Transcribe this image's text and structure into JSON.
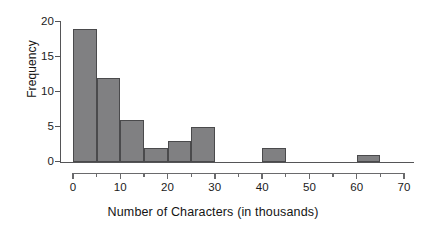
{
  "chart_data": {
    "type": "bar",
    "title": "",
    "subtitle": "",
    "xlabel": "Number of Characters (in thousands)",
    "ylabel": "Frequency",
    "xlim": [
      0,
      70
    ],
    "ylim": [
      0,
      20
    ],
    "grid": false,
    "legend": null,
    "bin_width": 5,
    "x_tick_labels": [
      "0",
      "10",
      "20",
      "30",
      "40",
      "50",
      "60",
      "70"
    ],
    "x_ticks": [
      0,
      10,
      20,
      30,
      40,
      50,
      60,
      70
    ],
    "x_minor_ticks": [
      5,
      15,
      25,
      35,
      45,
      55,
      65
    ],
    "y_tick_labels": [
      "0",
      "5",
      "10",
      "15",
      "20"
    ],
    "y_ticks": [
      0,
      5,
      10,
      15,
      20
    ],
    "bar_color": "#808082",
    "bar_edge_color": "#4a4a4c",
    "axis_color": "#555557",
    "background_color": "#ffffff",
    "bins": [
      {
        "x0": 0,
        "x1": 5,
        "value": 19
      },
      {
        "x0": 5,
        "x1": 10,
        "value": 12
      },
      {
        "x0": 10,
        "x1": 15,
        "value": 6
      },
      {
        "x0": 15,
        "x1": 20,
        "value": 2
      },
      {
        "x0": 20,
        "x1": 25,
        "value": 3
      },
      {
        "x0": 25,
        "x1": 30,
        "value": 5
      },
      {
        "x0": 40,
        "x1": 45,
        "value": 2
      },
      {
        "x0": 60,
        "x1": 65,
        "value": 1
      }
    ],
    "categories": [
      "0-5",
      "5-10",
      "10-15",
      "15-20",
      "20-25",
      "25-30",
      "30-35",
      "35-40",
      "40-45",
      "45-50",
      "50-55",
      "55-60",
      "60-65",
      "65-70"
    ],
    "values": [
      19,
      12,
      6,
      2,
      3,
      5,
      0,
      0,
      2,
      0,
      0,
      0,
      1,
      0
    ]
  }
}
